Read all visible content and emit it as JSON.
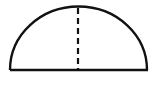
{
  "diagram": {
    "shape": "semicircle",
    "stroke_color": "#111111",
    "background_color": "#ffffff",
    "arc": {
      "cx": 78,
      "cy": 70,
      "rx": 69,
      "ry": 63
    },
    "diameter": {
      "x1": 10,
      "x2": 148,
      "y": 70
    },
    "radius_line": {
      "x": 78,
      "y1": 7,
      "y2": 70,
      "style": "dashed"
    },
    "labels": []
  }
}
